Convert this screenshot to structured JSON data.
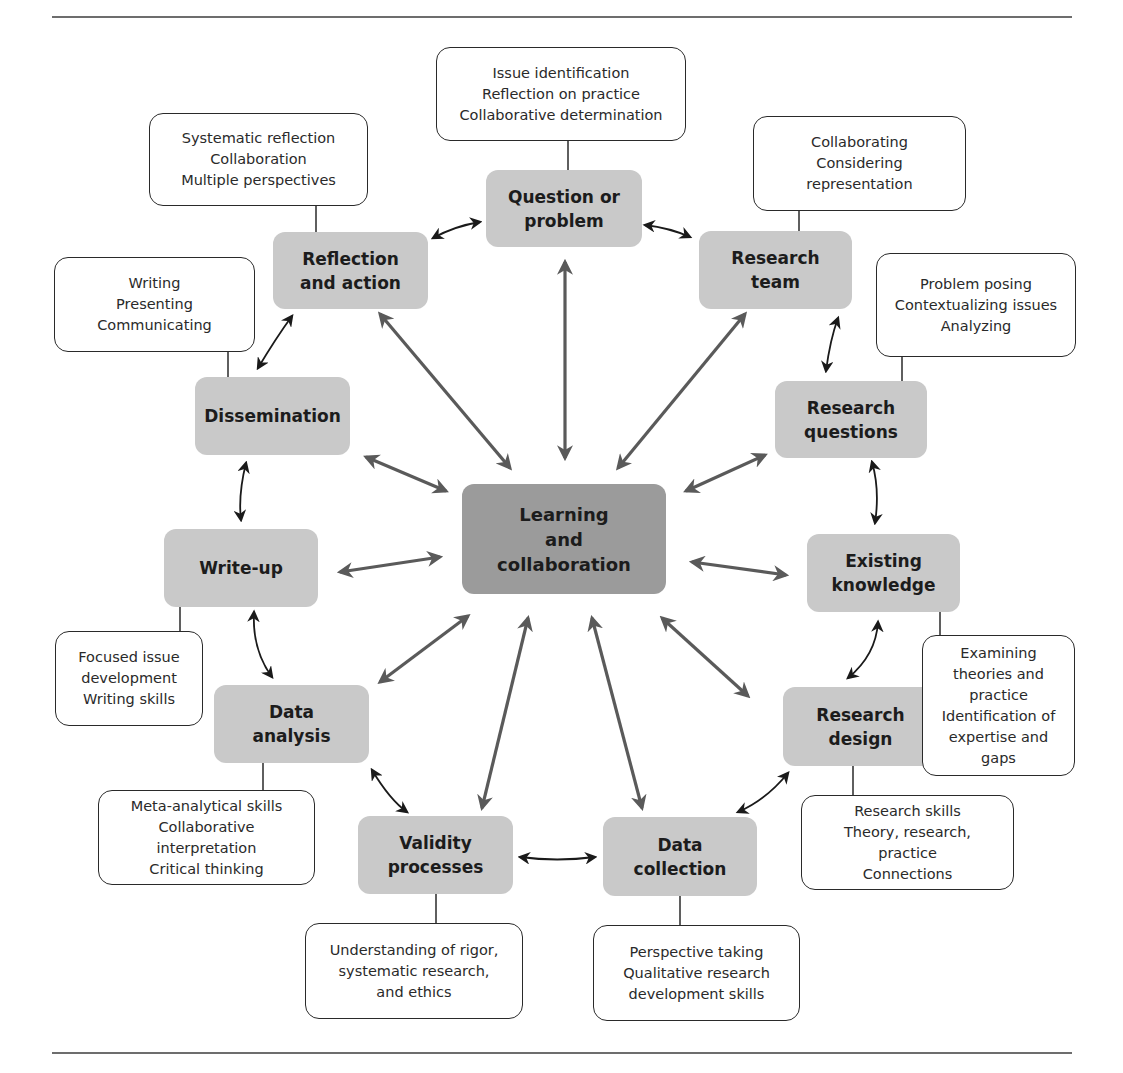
{
  "colors": {
    "node_fill": "#c9c9c9",
    "center_fill": "#9b9b9b",
    "thick_arrow": "#5a5a5a",
    "thin_arrow": "#1a1a1a",
    "note_border": "#2a2a2a"
  },
  "center": {
    "label": "Learning\nand\ncollaboration"
  },
  "nodes": [
    {
      "id": "question",
      "label": "Question or\nproblem"
    },
    {
      "id": "team",
      "label": "Research\nteam"
    },
    {
      "id": "questions",
      "label": "Research\nquestions"
    },
    {
      "id": "knowledge",
      "label": "Existing\nknowledge"
    },
    {
      "id": "design",
      "label": "Research\ndesign"
    },
    {
      "id": "collection",
      "label": "Data\ncollection"
    },
    {
      "id": "validity",
      "label": "Validity\nprocesses"
    },
    {
      "id": "analysis",
      "label": "Data\nanalysis"
    },
    {
      "id": "writeup",
      "label": "Write-up"
    },
    {
      "id": "dissemination",
      "label": "Dissemination"
    },
    {
      "id": "reflection",
      "label": "Reflection\nand action"
    }
  ],
  "notes": [
    {
      "for": "question",
      "text": "Issue identification\nReflection on practice\nCollaborative determination"
    },
    {
      "for": "team",
      "text": "Collaborating\nConsidering\nrepresentation"
    },
    {
      "for": "questions",
      "text": "Problem posing\nContextualizing issues\nAnalyzing"
    },
    {
      "for": "knowledge",
      "text": "Examining\ntheories and\npractice\nIdentification of\nexpertise and\ngaps"
    },
    {
      "for": "design",
      "text": "Research skills\nTheory, research,\npractice\nConnections"
    },
    {
      "for": "collection",
      "text": "Perspective taking\nQualitative research\ndevelopment skills"
    },
    {
      "for": "validity",
      "text": "Understanding of rigor,\nsystematic research,\nand ethics"
    },
    {
      "for": "analysis",
      "text": "Meta-analytical skills\nCollaborative\ninterpretation\nCritical thinking"
    },
    {
      "for": "writeup",
      "text": "Focused issue\ndevelopment\nWriting skills"
    },
    {
      "for": "dissemination",
      "text": "Writing\nPresenting\nCommunicating"
    },
    {
      "for": "reflection",
      "text": "Systematic reflection\nCollaboration\nMultiple perspectives"
    }
  ],
  "cycle_order": [
    "question",
    "team",
    "questions",
    "knowledge",
    "design",
    "collection",
    "validity",
    "analysis",
    "writeup",
    "dissemination",
    "reflection"
  ],
  "arrows": {
    "hub_type": "bidirectional",
    "cycle_type": "bidirectional"
  }
}
